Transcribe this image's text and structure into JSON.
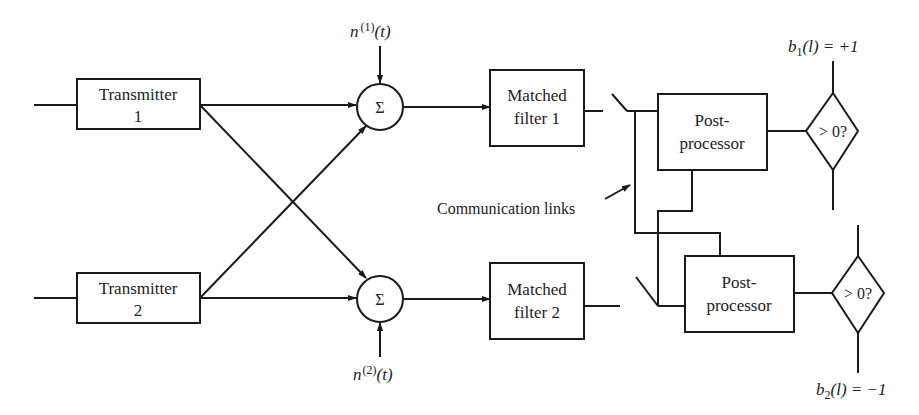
{
  "diagram": {
    "type": "block-diagram",
    "colors": {
      "stroke": "#1a1a1a",
      "text": "#222222",
      "background": "#ffffff"
    },
    "transmitters": [
      {
        "line1": "Transmitter",
        "line2": "1"
      },
      {
        "line1": "Transmitter",
        "line2": "2"
      }
    ],
    "summers": [
      {
        "symbol": "Σ",
        "noise_label": "n",
        "noise_sup": "(1)",
        "noise_arg": "(t)"
      },
      {
        "symbol": "Σ",
        "noise_label": "n",
        "noise_sup": "(2)",
        "noise_arg": "(t)"
      }
    ],
    "matched_filters": [
      {
        "line1": "Matched",
        "line2": "filter 1"
      },
      {
        "line1": "Matched",
        "line2": "filter 2"
      }
    ],
    "post_processors": [
      {
        "line1": "Post-",
        "line2": "processor"
      },
      {
        "line1": "Post-",
        "line2": "processor"
      }
    ],
    "decisions": [
      {
        "label": "> 0?",
        "out_var": "b",
        "out_sub": "1",
        "out_arg": "(l) = +1"
      },
      {
        "label": "> 0?",
        "out_var": "b",
        "out_sub": "2",
        "out_arg": "(l) = −1"
      }
    ],
    "annotation": "Communication links"
  }
}
